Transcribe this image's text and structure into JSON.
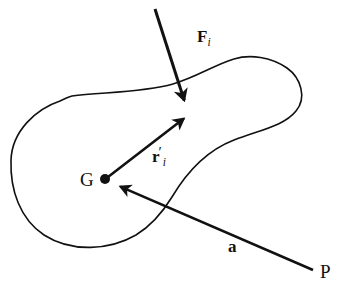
{
  "figure": {
    "background_color": "#ffffff",
    "stroke_color": "#111111"
  },
  "labels": {
    "force": {
      "symbol": "F",
      "subscript": "i",
      "prime": ""
    },
    "position": {
      "symbol": "r",
      "subscript": "i",
      "prime": "′"
    },
    "acceleration": {
      "symbol": "a",
      "subscript": "",
      "prime": ""
    },
    "centroid": {
      "text": "G"
    },
    "point_p": {
      "text": "P"
    }
  },
  "diagram_data": {
    "type": "free-body-diagram",
    "body_outline_closed": true,
    "points": [
      {
        "name": "G",
        "label": "G",
        "x": 105,
        "y": 179,
        "marker": "filled-dot",
        "radius": 5
      },
      {
        "name": "P",
        "label": "P",
        "x": 313,
        "y": 270,
        "marker": "none"
      },
      {
        "name": "application-point",
        "label": "",
        "x": 188,
        "y": 110,
        "marker": "none"
      }
    ],
    "vectors": [
      {
        "name": "force-vector",
        "label": "F_i",
        "from": {
          "x": 155,
          "y": 9
        },
        "to": {
          "x": 187,
          "y": 109
        },
        "arrowhead": "to",
        "stroke_width": 3.0
      },
      {
        "name": "position-vector",
        "label": "r'_i",
        "from": {
          "x": 108,
          "y": 177
        },
        "to": {
          "x": 191,
          "y": 113
        },
        "arrowhead": "to",
        "stroke_width": 2.6
      },
      {
        "name": "acceleration-vector",
        "label": "a",
        "from": {
          "x": 313,
          "y": 270
        },
        "to": {
          "x": 112,
          "y": 183
        },
        "arrowhead": "to",
        "stroke_width": 2.6
      }
    ],
    "body_outline_path": "M 60 101 C 36 109 12 131 11 160 C 10 190 20 218 44 234 C 72 252 108 250 134 236 C 152 226 162 212 170 199 C 186 172 205 152 232 141 C 258 131 282 127 295 112 C 306 99 300 79 286 69 C 270 58 250 55 234 60 C 214 66 196 78 172 84 C 140 92 104 89 78 95 Z",
    "outline_stroke_width": 1.6
  }
}
